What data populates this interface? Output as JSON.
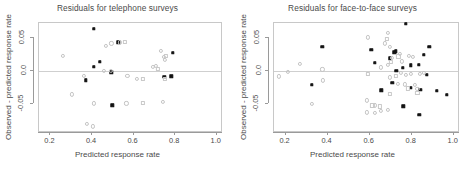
{
  "figure": {
    "width": 470,
    "height": 170,
    "background": "#ffffff",
    "frame_color": "#c8c8c8",
    "zeroline_color": "#cfcfcf"
  },
  "panels": [
    {
      "key": "telephone",
      "title": "Residuals for telephone surveys",
      "xlabel": "Predicted response rate",
      "ylabel": "Observed - predicted response rate"
    },
    {
      "key": "face_to_face",
      "title": "Residuals for face-to-face surveys",
      "xlabel": "Predicted response rate",
      "ylabel": "Observed - predicted response rate"
    }
  ],
  "chart_data": [
    {
      "type": "scatter",
      "title": "Residuals for telephone surveys",
      "xlabel": "Predicted response rate",
      "ylabel": "Observed - predicted response rate",
      "xlim": [
        0.145,
        1.03
      ],
      "ylim": [
        -0.093,
        0.072
      ],
      "xticks": [
        0.2,
        0.4,
        0.6,
        0.8,
        1.0
      ],
      "xticklabels": [
        "0.2",
        "0.4",
        "0.6",
        "0.8",
        "1.0"
      ],
      "yticks": [
        -0.05,
        0.0,
        0.05
      ],
      "yticklabels": [
        "-0.05",
        "0.0",
        "0.05"
      ],
      "grid": false,
      "legend": "none",
      "reference_line": {
        "y": 0.0,
        "color": "#cfcfcf"
      },
      "series": [
        {
          "name": "filled",
          "marker": "filled-square",
          "color": "#111111",
          "points": [
            [
              0.412,
              0.0615
            ],
            [
              0.531,
              0.0413
            ],
            [
              0.793,
              0.0255
            ],
            [
              0.443,
              0.0122
            ],
            [
              0.413,
              0.0052
            ],
            [
              0.497,
              -0.0035
            ],
            [
              0.374,
              -0.0155
            ],
            [
              0.752,
              -0.0098
            ],
            [
              0.787,
              -0.0093
            ],
            [
              0.503,
              -0.0528
            ]
          ]
        },
        {
          "name": "open",
          "marker": "open-circle",
          "color": "#c4c4c4",
          "points": [
            [
              0.498,
              0.04
            ],
            [
              0.47,
              0.0358
            ],
            [
              0.537,
              0.0415
            ],
            [
              0.263,
              0.0213
            ],
            [
              0.737,
              0.0283
            ],
            [
              0.75,
              0.0196
            ],
            [
              0.755,
              0.0148
            ],
            [
              0.697,
              0.0042
            ],
            [
              0.712,
              0.006
            ],
            [
              0.463,
              -0.0012
            ],
            [
              0.494,
              -0.0016
            ],
            [
              0.575,
              -0.0087
            ],
            [
              0.621,
              -0.0135
            ],
            [
              0.366,
              -0.009
            ],
            [
              0.307,
              -0.0365
            ],
            [
              0.413,
              -0.0502
            ],
            [
              0.57,
              -0.05
            ],
            [
              0.745,
              -0.0475
            ],
            [
              0.38,
              -0.081
            ],
            [
              0.408,
              -0.0845
            ]
          ]
        },
        {
          "name": "open-square",
          "marker": "open-square",
          "color": "#c9c9c9",
          "points": [
            [
              0.563,
              0.0418
            ],
            [
              0.762,
              0.0217
            ],
            [
              0.722,
              0.0018
            ],
            [
              0.755,
              -0.013
            ],
            [
              0.648,
              -0.0132
            ],
            [
              0.65,
              -0.049
            ]
          ]
        }
      ]
    },
    {
      "type": "scatter",
      "title": "Residuals for face-to-face surveys",
      "xlabel": "Predicted response rate",
      "ylabel": "Observed - predicted response rate",
      "xlim": [
        0.145,
        1.03
      ],
      "ylim": [
        -0.093,
        0.072
      ],
      "xticks": [
        0.2,
        0.4,
        0.6,
        0.8,
        1.0
      ],
      "xticklabels": [
        "0.2",
        "0.4",
        "0.6",
        "0.8",
        "1.0"
      ],
      "yticks": [
        -0.05,
        0.0,
        0.05
      ],
      "yticklabels": [
        "-0.05",
        "0.0",
        "0.05"
      ],
      "grid": false,
      "legend": "none",
      "reference_line": {
        "y": 0.0,
        "color": "#cfcfcf"
      },
      "series": [
        {
          "name": "filled",
          "marker": "filled-square",
          "color": "#111111",
          "points": [
            [
              0.776,
              0.069
            ],
            [
              0.38,
              0.0345
            ],
            [
              0.888,
              0.0345
            ],
            [
              0.612,
              0.03
            ],
            [
              0.73,
              0.0283
            ],
            [
              0.722,
              0.0268
            ],
            [
              0.862,
              0.0225
            ],
            [
              0.7,
              0.0178
            ],
            [
              0.628,
              0.0108
            ],
            [
              0.8,
              0.0072
            ],
            [
              0.838,
              0.0075
            ],
            [
              0.762,
              0.0035
            ],
            [
              0.732,
              -0.0015
            ],
            [
              0.877,
              -0.0072
            ],
            [
              0.33,
              -0.0222
            ],
            [
              0.712,
              -0.019
            ],
            [
              0.66,
              -0.0302
            ],
            [
              0.802,
              -0.0268
            ],
            [
              0.845,
              -0.0298
            ],
            [
              0.925,
              -0.0315
            ],
            [
              0.972,
              -0.0375
            ],
            [
              0.765,
              -0.0545
            ],
            [
              0.842,
              -0.0672
            ]
          ]
        },
        {
          "name": "open",
          "marker": "open-circle",
          "color": "#c4c4c4",
          "points": [
            [
              0.69,
              0.056
            ],
            [
              0.596,
              0.049
            ],
            [
              0.678,
              0.0398
            ],
            [
              0.7,
              0.0352
            ],
            [
              0.272,
              0.009
            ],
            [
              0.748,
              0.024
            ],
            [
              0.79,
              0.0215
            ],
            [
              0.812,
              0.0195
            ],
            [
              0.712,
              0.0185
            ],
            [
              0.758,
              0.013
            ],
            [
              0.69,
              0.0072
            ],
            [
              0.66,
              0.004
            ],
            [
              0.38,
              0.0008
            ],
            [
              0.215,
              -0.0025
            ],
            [
              0.172,
              -0.0095
            ],
            [
              0.382,
              -0.0155
            ],
            [
              0.752,
              -0.0048
            ],
            [
              0.778,
              -0.0075
            ],
            [
              0.8,
              -0.0058
            ],
            [
              0.845,
              -0.006
            ],
            [
              0.862,
              -0.0042
            ],
            [
              0.7,
              -0.011
            ],
            [
              0.738,
              -0.021
            ],
            [
              0.772,
              -0.0215
            ],
            [
              0.822,
              -0.0225
            ],
            [
              0.832,
              -0.028
            ],
            [
              0.332,
              -0.051
            ],
            [
              0.592,
              -0.0455
            ],
            [
              0.63,
              -0.053
            ],
            [
              0.592,
              -0.0635
            ],
            [
              0.66,
              -0.061
            ],
            [
              0.69,
              -0.06
            ],
            [
              0.628,
              -0.0648
            ]
          ]
        },
        {
          "name": "open-square",
          "marker": "open-square",
          "color": "#c9c9c9",
          "points": [
            [
              0.688,
              0.0472
            ],
            [
              0.742,
              0.0205
            ],
            [
              0.705,
              0.012
            ],
            [
              0.596,
              -0.006
            ],
            [
              0.728,
              -0.0088
            ],
            [
              0.785,
              -0.0275
            ],
            [
              0.832,
              -0.0345
            ],
            [
              0.7,
              -0.0355
            ],
            [
              0.618,
              -0.053
            ],
            [
              0.652,
              -0.0545
            ]
          ]
        }
      ]
    }
  ]
}
